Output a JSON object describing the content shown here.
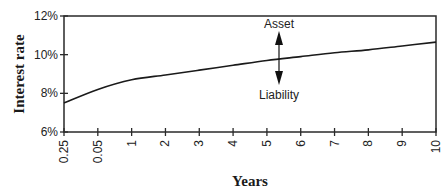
{
  "chart_data": {
    "type": "line",
    "title": "",
    "xlabel": "Years",
    "ylabel": "Interest rate",
    "categories": [
      "0.25",
      "0.05",
      "1",
      "2",
      "3",
      "4",
      "5",
      "6",
      "7",
      "8",
      "9",
      "10"
    ],
    "series": [
      {
        "name": "Yield curve",
        "values": [
          7.5,
          8.2,
          8.7,
          8.95,
          9.2,
          9.45,
          9.7,
          9.9,
          10.1,
          10.25,
          10.45,
          10.65
        ]
      }
    ],
    "y_ticks": [
      "6%",
      "8%",
      "10%",
      "12%"
    ],
    "ylim": [
      6,
      12
    ],
    "grid": false,
    "legend": null,
    "annotations": [
      {
        "text": "Asset",
        "arrow": "up",
        "at_category": "5"
      },
      {
        "text": "Liability",
        "arrow": "down",
        "at_category": "5"
      }
    ]
  },
  "labels": {
    "ylabel": "Interest rate",
    "xlabel": "Years",
    "asset": "Asset",
    "liability": "Liability",
    "y_ticks": [
      "6%",
      "8%",
      "10%",
      "12%"
    ],
    "x_ticks": [
      "0.25",
      "0.05",
      "1",
      "2",
      "3",
      "4",
      "5",
      "6",
      "7",
      "8",
      "9",
      "10"
    ]
  }
}
